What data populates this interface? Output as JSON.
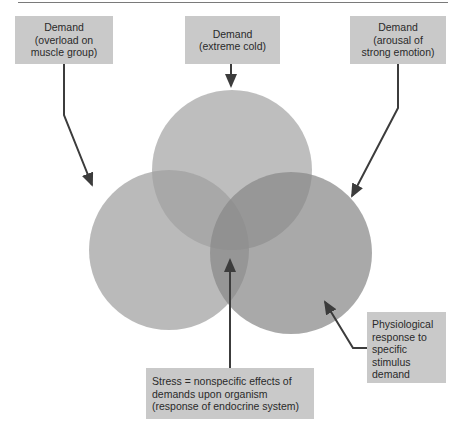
{
  "diagram": {
    "type": "venn",
    "demand_boxes": [
      {
        "lines": [
          "Demand",
          "(overload on",
          "muscle group)"
        ]
      },
      {
        "lines": [
          "Demand",
          "(extreme cold)"
        ]
      },
      {
        "lines": [
          "Demand",
          "(arousal of",
          "strong emotion)"
        ]
      }
    ],
    "stress_box": {
      "lines": [
        "Stress = nonspecific effects of",
        "demands upon organism",
        "(response of endocrine system)"
      ]
    },
    "response_box": {
      "lines": [
        "Physiological",
        "response to",
        "specific",
        "stimulus",
        "demand"
      ]
    },
    "colors": {
      "box_fill": "#c9c9c9",
      "circle_fill": "#9a9a9a",
      "line": "#3c3c3c"
    }
  }
}
